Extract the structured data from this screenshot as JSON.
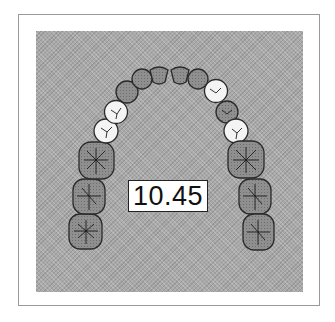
{
  "figure": {
    "type": "dental-arch-diagram",
    "measurement_label": "10.45",
    "colors": {
      "background": "#a9a9a9",
      "tooth_dark": "#8f8f8f",
      "tooth_light": "#f4f4f4",
      "outline": "#2a2a2a",
      "frame_border": "#9a9a9a"
    },
    "teeth": [
      {
        "id": "upper-right-molar-3",
        "side": "right",
        "kind": "molar",
        "shade": "dark"
      },
      {
        "id": "upper-right-molar-2",
        "side": "right",
        "kind": "molar",
        "shade": "dark"
      },
      {
        "id": "upper-right-molar-1",
        "side": "right",
        "kind": "molar",
        "shade": "dark"
      },
      {
        "id": "upper-right-premolar-2",
        "side": "right",
        "kind": "premolar",
        "shade": "light"
      },
      {
        "id": "upper-right-premolar-1",
        "side": "right",
        "kind": "premolar",
        "shade": "light"
      },
      {
        "id": "upper-right-canine",
        "side": "right",
        "kind": "canine",
        "shade": "dark"
      },
      {
        "id": "upper-right-lateral-incisor",
        "side": "right",
        "kind": "incisor",
        "shade": "dark"
      },
      {
        "id": "upper-right-central-incisor",
        "side": "right",
        "kind": "incisor",
        "shade": "dark"
      },
      {
        "id": "upper-left-central-incisor",
        "side": "left",
        "kind": "incisor",
        "shade": "dark"
      },
      {
        "id": "upper-left-lateral-incisor",
        "side": "left",
        "kind": "incisor",
        "shade": "dark"
      },
      {
        "id": "upper-left-canine",
        "side": "left",
        "kind": "canine",
        "shade": "light"
      },
      {
        "id": "upper-left-premolar-1",
        "side": "left",
        "kind": "premolar",
        "shade": "dark"
      },
      {
        "id": "upper-left-premolar-2",
        "side": "left",
        "kind": "premolar",
        "shade": "light"
      },
      {
        "id": "upper-left-molar-1",
        "side": "left",
        "kind": "molar",
        "shade": "dark"
      },
      {
        "id": "upper-left-molar-2",
        "side": "left",
        "kind": "molar",
        "shade": "dark"
      },
      {
        "id": "upper-left-molar-3",
        "side": "left",
        "kind": "molar",
        "shade": "dark"
      }
    ]
  }
}
